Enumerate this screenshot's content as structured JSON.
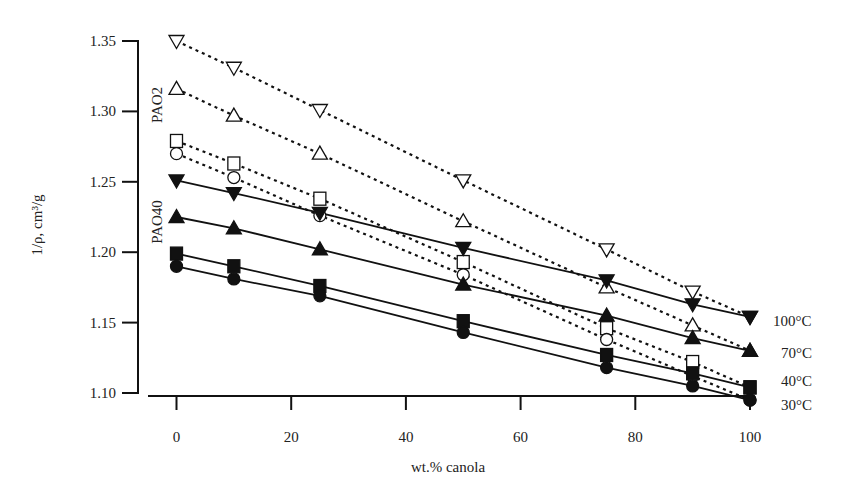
{
  "chart_data": {
    "type": "scatter",
    "title": "",
    "xlabel": "wt.% canola",
    "ylabel": "1/ρ, cm³/g",
    "xlim": [
      -3,
      100
    ],
    "ylim": [
      1.1,
      1.35
    ],
    "xticks": [
      0,
      20,
      40,
      60,
      80,
      100
    ],
    "xtick_labels": [
      "0",
      "20",
      "40",
      "60",
      "80",
      "100"
    ],
    "yticks": [
      1.1,
      1.15,
      1.2,
      1.25,
      1.3,
      1.35
    ],
    "ytick_labels": [
      "1.10",
      "1.15",
      "1.20",
      "1.25",
      "1.30",
      "1.35"
    ],
    "grid": false,
    "x": [
      0,
      10,
      25,
      50,
      75,
      90,
      100
    ],
    "series": [
      {
        "name": "PAO2 100°C",
        "group": "PAO2",
        "temperature": "100°C",
        "marker": "triangle-down",
        "filled": false,
        "line": "dotted",
        "values": [
          1.35,
          1.331,
          1.301,
          1.251,
          1.202,
          1.172,
          1.154
        ]
      },
      {
        "name": "PAO2 70°C",
        "group": "PAO2",
        "temperature": "70°C",
        "marker": "triangle-up",
        "filled": false,
        "line": "dotted",
        "values": [
          1.316,
          1.297,
          1.27,
          1.222,
          1.175,
          1.148,
          1.13
        ]
      },
      {
        "name": "PAO2 40°C",
        "group": "PAO2",
        "temperature": "40°C",
        "marker": "square",
        "filled": false,
        "line": "dotted",
        "values": [
          1.279,
          1.263,
          1.238,
          1.193,
          1.146,
          1.122,
          1.104
        ]
      },
      {
        "name": "PAO2 30°C",
        "group": "PAO2",
        "temperature": "30°C",
        "marker": "circle",
        "filled": false,
        "line": "dotted",
        "values": [
          1.27,
          1.253,
          1.226,
          1.184,
          1.138,
          1.112,
          1.095
        ]
      },
      {
        "name": "PAO40 100°C",
        "group": "PAO40",
        "temperature": "100°C",
        "marker": "triangle-down",
        "filled": true,
        "line": "solid",
        "values": [
          1.251,
          1.242,
          1.228,
          1.203,
          1.18,
          1.163,
          1.154
        ]
      },
      {
        "name": "PAO40 70°C",
        "group": "PAO40",
        "temperature": "70°C",
        "marker": "triangle-up",
        "filled": true,
        "line": "solid",
        "values": [
          1.225,
          1.217,
          1.202,
          1.177,
          1.155,
          1.139,
          1.13
        ]
      },
      {
        "name": "PAO40 40°C",
        "group": "PAO40",
        "temperature": "40°C",
        "marker": "square",
        "filled": true,
        "line": "solid",
        "values": [
          1.199,
          1.19,
          1.176,
          1.151,
          1.127,
          1.114,
          1.104
        ]
      },
      {
        "name": "PAO40 30°C",
        "group": "PAO40",
        "temperature": "30°C",
        "marker": "circle",
        "filled": true,
        "line": "solid",
        "values": [
          1.19,
          1.181,
          1.169,
          1.143,
          1.118,
          1.105,
          1.095
        ]
      }
    ],
    "annotations": [
      {
        "text": "PAO2",
        "rotated": true,
        "near": "PAO2 series at x=0"
      },
      {
        "text": "PAO40",
        "rotated": true,
        "near": "PAO40 series at x=0"
      }
    ],
    "right_labels": [
      {
        "text": "100°C",
        "value": 1.154
      },
      {
        "text": "70°C",
        "value": 1.13
      },
      {
        "text": "40°C",
        "value": 1.113
      },
      {
        "text": "30°C",
        "value": 1.095
      }
    ],
    "colors": {
      "ink": "#111111",
      "background": "#ffffff"
    }
  }
}
